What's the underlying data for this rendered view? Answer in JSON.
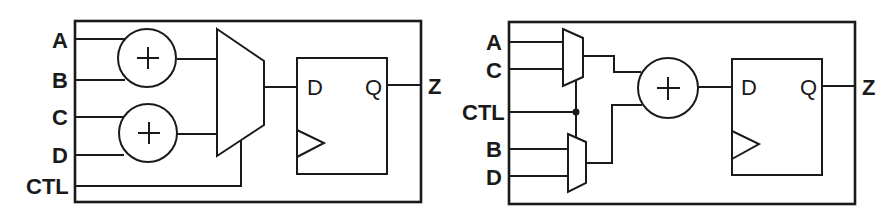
{
  "diagrams": [
    {
      "id": "left",
      "inputs": [
        "A",
        "B",
        "C",
        "D",
        "CTL"
      ],
      "output": "Z",
      "adder_symbol": "+",
      "flipflop": {
        "d_label": "D",
        "q_label": "Q"
      }
    },
    {
      "id": "right",
      "inputs": [
        "A",
        "C",
        "CTL",
        "B",
        "D"
      ],
      "output": "Z",
      "adder_symbol": "+",
      "flipflop": {
        "d_label": "D",
        "q_label": "Q"
      }
    }
  ]
}
